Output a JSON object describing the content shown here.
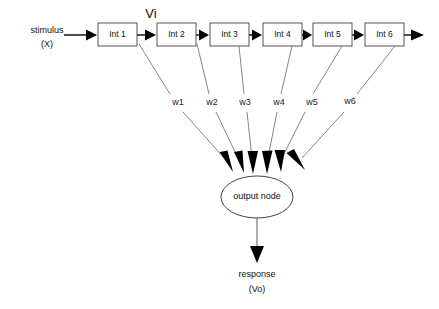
{
  "diagram": {
    "background_color": "#ffffff",
    "input": {
      "label_line1": "stimulus",
      "label_line2": "(X)"
    },
    "signal_label": "Vi",
    "nodes": [
      {
        "label": "Int 1"
      },
      {
        "label": "Int 2"
      },
      {
        "label": "Int 3"
      },
      {
        "label": "Int 4"
      },
      {
        "label": "Int 5"
      },
      {
        "label": "Int 6"
      }
    ],
    "weights": [
      {
        "label": "w1"
      },
      {
        "label": "w2"
      },
      {
        "label": "w3"
      },
      {
        "label": "w4"
      },
      {
        "label": "w5"
      },
      {
        "label": "w6"
      }
    ],
    "output_node": {
      "label": "output node"
    },
    "output": {
      "label_line1": "response",
      "label_line2": "(Vo)"
    },
    "colors": {
      "box_stroke": "#555555",
      "line": "#222222",
      "weight_line": "#777777",
      "text": "#111111",
      "arrow": "#000000"
    }
  }
}
